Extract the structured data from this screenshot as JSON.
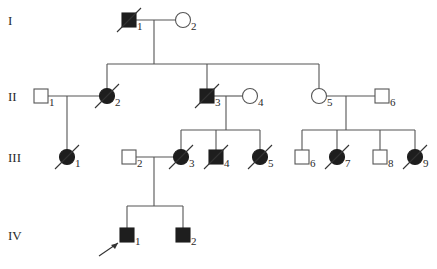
{
  "diagram": {
    "type": "pedigree",
    "generations": [
      {
        "label": "I",
        "y": 20
      },
      {
        "label": "II",
        "y": 96
      },
      {
        "label": "III",
        "y": 157
      },
      {
        "label": "IV",
        "y": 235
      }
    ],
    "individuals": [
      {
        "id": "I-1",
        "num": "1",
        "sex": "male",
        "affected": true,
        "deceased": true,
        "x": 129,
        "y": 20
      },
      {
        "id": "I-2",
        "num": "2",
        "sex": "female",
        "affected": false,
        "deceased": false,
        "x": 183,
        "y": 20
      },
      {
        "id": "II-1",
        "num": "1",
        "sex": "male",
        "affected": false,
        "deceased": false,
        "x": 41,
        "y": 96
      },
      {
        "id": "II-2",
        "num": "2",
        "sex": "female",
        "affected": true,
        "deceased": true,
        "x": 107,
        "y": 96
      },
      {
        "id": "II-3",
        "num": "3",
        "sex": "male",
        "affected": true,
        "deceased": true,
        "x": 207,
        "y": 96
      },
      {
        "id": "II-4",
        "num": "4",
        "sex": "female",
        "affected": false,
        "deceased": false,
        "x": 250,
        "y": 96
      },
      {
        "id": "II-5",
        "num": "5",
        "sex": "female",
        "affected": false,
        "deceased": false,
        "x": 319,
        "y": 96
      },
      {
        "id": "II-6",
        "num": "6",
        "sex": "male",
        "affected": false,
        "deceased": false,
        "x": 382,
        "y": 96
      },
      {
        "id": "III-1",
        "num": "1",
        "sex": "female",
        "affected": true,
        "deceased": true,
        "x": 67,
        "y": 157
      },
      {
        "id": "III-2",
        "num": "2",
        "sex": "male",
        "affected": false,
        "deceased": false,
        "x": 129,
        "y": 157
      },
      {
        "id": "III-3",
        "num": "3",
        "sex": "female",
        "affected": true,
        "deceased": true,
        "x": 181,
        "y": 157
      },
      {
        "id": "III-4",
        "num": "4",
        "sex": "male",
        "affected": true,
        "deceased": true,
        "x": 216,
        "y": 157
      },
      {
        "id": "III-5",
        "num": "5",
        "sex": "female",
        "affected": true,
        "deceased": true,
        "x": 260,
        "y": 157
      },
      {
        "id": "III-6",
        "num": "6",
        "sex": "male",
        "affected": false,
        "deceased": false,
        "x": 302,
        "y": 157
      },
      {
        "id": "III-7",
        "num": "7",
        "sex": "female",
        "affected": true,
        "deceased": true,
        "x": 337,
        "y": 157
      },
      {
        "id": "III-8",
        "num": "8",
        "sex": "male",
        "affected": false,
        "deceased": false,
        "x": 380,
        "y": 157
      },
      {
        "id": "III-9",
        "num": "9",
        "sex": "female",
        "affected": true,
        "deceased": true,
        "x": 415,
        "y": 157
      },
      {
        "id": "IV-1",
        "num": "1",
        "sex": "male",
        "affected": true,
        "deceased": false,
        "proband": true,
        "x": 127,
        "y": 235
      },
      {
        "id": "IV-2",
        "num": "2",
        "sex": "male",
        "affected": true,
        "deceased": false,
        "x": 183,
        "y": 235
      }
    ],
    "matings": [
      {
        "from": "I-1",
        "to": "I-2",
        "drop_x": 154,
        "children": [
          "II-2",
          "II-3",
          "II-5"
        ],
        "sibship_y": 64
      },
      {
        "from": "II-1",
        "to": "II-2",
        "drop_x": 67,
        "children": [
          "III-1"
        ],
        "sibship_y": null
      },
      {
        "from": "II-3",
        "to": "II-4",
        "drop_x": 226,
        "children": [
          "III-3",
          "III-4",
          "III-5"
        ],
        "sibship_y": 130
      },
      {
        "from": "II-5",
        "to": "II-6",
        "drop_x": 346,
        "children": [
          "III-6",
          "III-7",
          "III-8",
          "III-9"
        ],
        "sibship_y": 130
      },
      {
        "from": "III-2",
        "to": "III-3",
        "drop_x": 154,
        "children": [
          "IV-1",
          "IV-2"
        ],
        "sibship_y": 206
      }
    ],
    "colors": {
      "affected": "#1e1e1e",
      "unaffected": "#ffffff",
      "line": "#555555"
    }
  }
}
